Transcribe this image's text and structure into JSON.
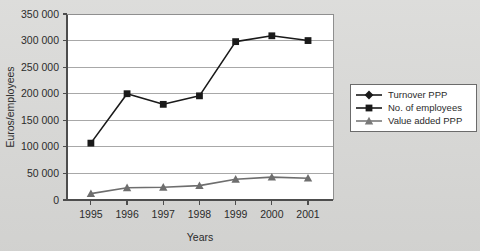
{
  "chart_data": {
    "type": "line",
    "title": "",
    "xlabel": "Years",
    "ylabel": "Euros/employees",
    "categories": [
      "1995",
      "1996",
      "1997",
      "1998",
      "1999",
      "2000",
      "2001"
    ],
    "ylim": [
      0,
      350000
    ],
    "ytick_step": 50000,
    "ytick_labels": [
      "0",
      "50 000",
      "100 000",
      "150 000",
      "200 000",
      "250 000",
      "300 000",
      "350 000"
    ],
    "ytick_values": [
      0,
      50000,
      100000,
      150000,
      200000,
      250000,
      300000,
      350000
    ],
    "grid": "horizontal",
    "legend_position": "right",
    "series": [
      {
        "name": "Turnover PPP",
        "marker": "diamond",
        "color": "#1a1a1a",
        "values": [
          null,
          null,
          null,
          null,
          null,
          null,
          null
        ]
      },
      {
        "name": "No. of employees",
        "marker": "square",
        "color": "#1a1a1a",
        "values": [
          107000,
          200000,
          180000,
          196000,
          298000,
          309000,
          300000
        ]
      },
      {
        "name": "Value added PPP",
        "marker": "triangle",
        "color": "#6e6e6e",
        "values": [
          12000,
          23000,
          24000,
          27000,
          39000,
          43000,
          41000
        ]
      }
    ]
  },
  "legend": {
    "items": [
      {
        "label": "Turnover PPP",
        "marker": "diamond-marker",
        "color": "#1a1a1a"
      },
      {
        "label": "No. of employees",
        "marker": "square-marker",
        "color": "#1a1a1a"
      },
      {
        "label": "Value added PPP",
        "marker": "triangle-marker",
        "color": "#7a7a7a"
      }
    ]
  },
  "colors": {
    "page_background": "#d9d9d7",
    "plot_background": "#ffffff",
    "gridline": "#a8a8a8",
    "axis": "#4d4d4d",
    "series_dark": "#1a1a1a",
    "series_gray": "#6e6e6e"
  }
}
